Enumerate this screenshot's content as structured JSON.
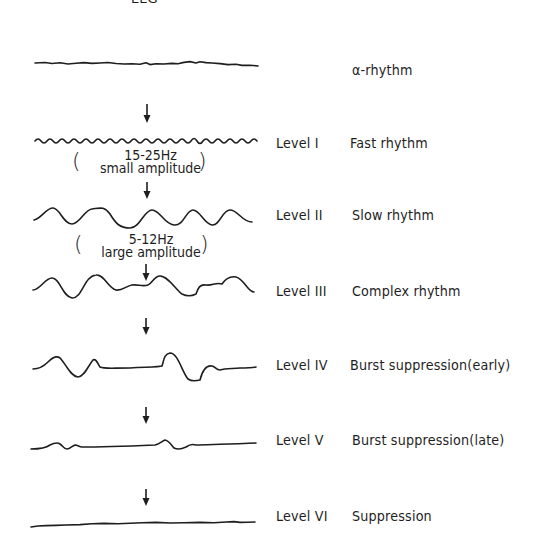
{
  "title": "EEG",
  "rows": [
    {
      "id": "alpha",
      "level": "",
      "description": "α-rhythm"
    },
    {
      "id": "level-1",
      "level": "Level I",
      "description": "Fast rhythm"
    },
    {
      "id": "level-2",
      "level": "Level II",
      "description": "Slow rhythm"
    },
    {
      "id": "level-3",
      "level": "Level III",
      "description": "Complex rhythm"
    },
    {
      "id": "level-4",
      "level": "Level IV",
      "description": "Burst suppression(early)"
    },
    {
      "id": "level-5",
      "level": "Level V",
      "description": "Burst suppression(late)"
    },
    {
      "id": "level-6",
      "level": "Level VI",
      "description": "Suppression"
    }
  ],
  "annotations": {
    "fast": {
      "frequency": "15-25Hz",
      "amplitude": "small amplitude"
    },
    "slow": {
      "frequency": "5-12Hz",
      "amplitude": "large amplitude"
    }
  },
  "parens": {
    "open": "(",
    "close": ")"
  },
  "colors": {
    "ink": "#1e1e1e",
    "background": "#ffffff"
  }
}
